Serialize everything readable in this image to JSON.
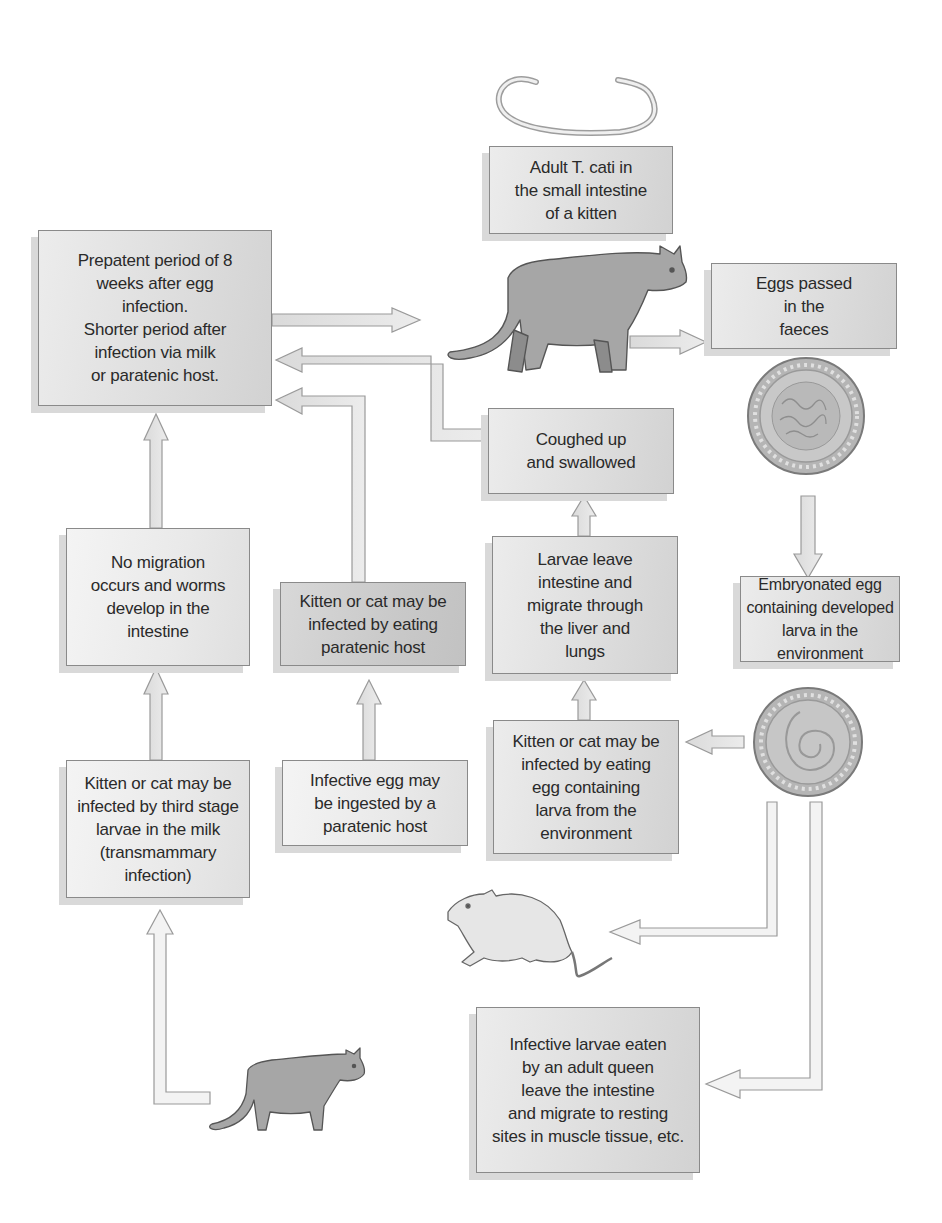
{
  "diagram": {
    "nodes": {
      "adult": {
        "text": "Adult T. cati in\nthe small intestine\nof a kitten"
      },
      "prepatent": {
        "text": "Prepatent period of 8\nweeks after egg\ninfection.\nShorter period after\ninfection via milk\nor paratenic host."
      },
      "eggs_passed": {
        "text": "Eggs passed\nin the\nfaeces"
      },
      "coughed": {
        "text": "Coughed up\nand swallowed"
      },
      "larvae_leave": {
        "text": "Larvae leave\nintestine and\nmigrate through\nthe liver and\nlungs"
      },
      "embryonated": {
        "text": "Embryonated egg\ncontaining developed\nlarva in the environment"
      },
      "no_migration": {
        "text": "No migration\noccurs and worms\ndevelop in the\nintestine"
      },
      "paratenic_eat": {
        "text": "Kitten or cat may be\ninfected by eating\nparatenic host"
      },
      "egg_eat": {
        "text": "Kitten or cat may be\ninfected by eating\negg containing\nlarva from the\nenvironment"
      },
      "milk": {
        "text": "Kitten or cat may be\ninfected by third stage\nlarvae in the milk\n(transmammary\ninfection)"
      },
      "egg_ingested": {
        "text": "Infective egg may\nbe ingested by a\nparatenic host"
      },
      "queen": {
        "text": "Infective larvae eaten\nby an adult queen\nleave the intestine\nand migrate to resting\nsites in muscle tissue, etc."
      }
    },
    "illustrations": [
      {
        "name": "adult-worm",
        "label": "Adult T. cati worm"
      },
      {
        "name": "kitten",
        "label": "Kitten (definitive host)"
      },
      {
        "name": "unembryonated-egg",
        "label": "Egg passed in faeces"
      },
      {
        "name": "embryonated-egg",
        "label": "Egg containing larva"
      },
      {
        "name": "rodent",
        "label": "Paratenic host (rodent)"
      },
      {
        "name": "queen-cat",
        "label": "Adult queen"
      }
    ],
    "edges": [
      {
        "from": "prepatent",
        "to": "kitten"
      },
      {
        "from": "kitten",
        "to": "eggs_passed"
      },
      {
        "from": "unembryonated-egg",
        "to": "embryonated"
      },
      {
        "from": "embryonated-egg",
        "to": "egg_eat"
      },
      {
        "from": "egg_eat",
        "to": "larvae_leave"
      },
      {
        "from": "larvae_leave",
        "to": "coughed"
      },
      {
        "from": "coughed",
        "to": "prepatent"
      },
      {
        "from": "paratenic_eat",
        "to": "prepatent"
      },
      {
        "from": "egg_ingested",
        "to": "paratenic_eat"
      },
      {
        "from": "no_migration",
        "to": "prepatent"
      },
      {
        "from": "milk",
        "to": "no_migration"
      },
      {
        "from": "queen-cat",
        "to": "milk"
      },
      {
        "from": "embryonated-egg",
        "to": "rodent"
      },
      {
        "from": "embryonated-egg",
        "to": "queen"
      }
    ],
    "colors": {
      "box_fill": "#dedede",
      "box_border": "#8a8a8a",
      "arrow_fill": "#e2e2e2",
      "arrow_stroke": "#9a9a9a",
      "cat_fill": "#a8a8a8",
      "text": "#2a2a2a"
    }
  }
}
